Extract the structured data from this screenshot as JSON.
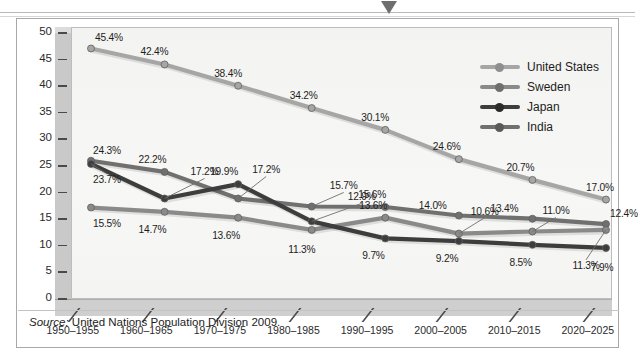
{
  "figure": {
    "source_prefix": "Source:",
    "source_text": " United Nations Population Division 2009.",
    "marker_icon": "down-triangle-icon"
  },
  "legend": {
    "position": "inside-top-right",
    "items": [
      {
        "label": "United States",
        "color": "#a6a6a6"
      },
      {
        "label": "Sweden",
        "color": "#8a8a8a"
      },
      {
        "label": "Japan",
        "color": "#3d3d3d"
      },
      {
        "label": "India",
        "color": "#707070"
      }
    ]
  },
  "chart_data": {
    "type": "line",
    "title": "",
    "subtitle": "",
    "xlabel": "",
    "ylabel": "",
    "ylim": [
      0,
      50
    ],
    "yticks": [
      0,
      5,
      10,
      15,
      20,
      25,
      30,
      35,
      40,
      45,
      50
    ],
    "ytick_labels": [
      "0",
      "5",
      "10",
      "15",
      "20",
      "25",
      "30",
      "35",
      "40",
      "45",
      "50"
    ],
    "grid": false,
    "categories": [
      "1950–1955",
      "1960–1965",
      "1970–1975",
      "1980–1985",
      "1990–1995",
      "2000–2005",
      "2010–2015",
      "2020–2025"
    ],
    "series": [
      {
        "name": "United States",
        "color": "#a6a6a6",
        "values": [
          45.4,
          42.4,
          38.4,
          34.2,
          30.1,
          24.6,
          20.7,
          17.0
        ],
        "labels": [
          "45.4%",
          "42.4%",
          "38.4%",
          "34.2%",
          "30.1%",
          "24.6%",
          "20.7%",
          "17.0%"
        ]
      },
      {
        "name": "India",
        "color": "#707070",
        "values": [
          24.3,
          22.2,
          17.2,
          15.7,
          15.6,
          14.0,
          13.4,
          12.4
        ],
        "labels": [
          "24.3%",
          "22.2%",
          "17.2%",
          "15.7%",
          "15.6%",
          "14.0%",
          "13.4%",
          "12.4%"
        ]
      },
      {
        "name": "Japan",
        "color": "#3d3d3d",
        "values": [
          23.7,
          17.2,
          19.9,
          12.9,
          9.7,
          9.2,
          8.5,
          7.9
        ],
        "labels": [
          "23.7%",
          "17.2%",
          "19.9%",
          "12.9%",
          "9.7%",
          "9.2%",
          "8.5%",
          "7.9%"
        ]
      },
      {
        "name": "Sweden",
        "color": "#8a8a8a",
        "values": [
          15.5,
          14.7,
          13.6,
          11.3,
          13.6,
          10.6,
          11.0,
          11.3
        ],
        "labels": [
          "15.5%",
          "14.7%",
          "13.6%",
          "11.3%",
          "13.6%",
          "10.6%",
          "11.0%",
          "11.3%"
        ]
      }
    ],
    "annotations": [
      {
        "text": "15.6%",
        "note": "India 1990-1995 shown above point"
      },
      {
        "text": "12.9%",
        "note": "Japan 1980-1985 with leader line"
      },
      {
        "text": "17.2%",
        "note": "Japan 1960-1965 with leader line"
      },
      {
        "text": "15.7%",
        "note": "India 1980-1985 with leader line"
      },
      {
        "text": "10.6%",
        "note": "Sweden 2000-2005 with leader line"
      },
      {
        "text": "11.0%",
        "note": "Sweden 2010-2015 with leader line"
      },
      {
        "text": "11.3%",
        "note": "Sweden 2020-2025 with leader line"
      },
      {
        "text": "23.7%",
        "note": "Japan 1950-1955 with leader line"
      }
    ]
  }
}
